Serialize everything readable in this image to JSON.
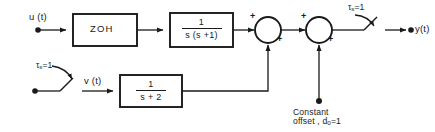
{
  "diagram": {
    "stroke_color": "#1a1a1a",
    "background": "#ffffff",
    "signals": {
      "input_u": "u (t)",
      "mid_v": "v (t)",
      "output_y": "y(t)"
    },
    "blocks": [
      {
        "id": "zoh",
        "label": "ZOH",
        "kind": "text"
      },
      {
        "id": "plant",
        "numerator": "1",
        "denominator": "s (s +1)",
        "kind": "fraction"
      },
      {
        "id": "second_path",
        "numerator": "1",
        "denominator": "s + 2",
        "kind": "fraction"
      }
    ],
    "summing_junctions": [
      {
        "id": "sum1",
        "sign_in_left": "+",
        "sign_in_bottom": "+"
      },
      {
        "id": "sum2",
        "sign_in_left": "+",
        "sign_in_bottom": "+"
      }
    ],
    "switches": [
      {
        "id": "switch-input",
        "label_tau": "τ",
        "label_sub": "s",
        "label_value": "=1"
      },
      {
        "id": "switch-output",
        "label_tau": "τ",
        "label_sub": "s",
        "label_value": "=1"
      }
    ],
    "annotations": {
      "offset_line1": "Constant",
      "offset_line2_pre": "offset ,",
      "offset_symbol": "d",
      "offset_sub": "0",
      "offset_value": "=1"
    }
  }
}
